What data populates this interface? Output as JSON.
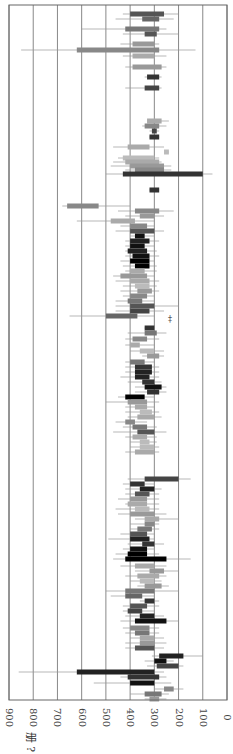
{
  "chart_data": {
    "type": "bar",
    "orientation": "rotated-90",
    "title": "",
    "xlabel": "",
    "ylabel": "册 ?",
    "axis_ticks": [
      "900",
      "800",
      "700",
      "600",
      "500",
      "400",
      "300",
      "200",
      "100",
      "0"
    ],
    "value_range": [
      0,
      900
    ],
    "grid": true,
    "legend": null,
    "annotation": "‡",
    "rows": [
      {
        "y": 14,
        "lo": 260,
        "hi": 400,
        "wlo": 200,
        "whi": 430,
        "shade": "#555"
      },
      {
        "y": 19,
        "lo": 280,
        "hi": 350,
        "wlo": 220,
        "whi": 460,
        "shade": "#666"
      },
      {
        "y": 29,
        "lo": 280,
        "hi": 420,
        "wlo": 250,
        "whi": 600,
        "shade": "#777"
      },
      {
        "y": 34,
        "lo": 290,
        "hi": 340,
        "wlo": 200,
        "whi": 430,
        "shade": "#555"
      },
      {
        "y": 44,
        "lo": 300,
        "hi": 390,
        "wlo": 280,
        "whi": 440,
        "shade": "#999"
      },
      {
        "y": 50,
        "lo": 280,
        "hi": 620,
        "wlo": 130,
        "whi": 850,
        "shade": "#888"
      },
      {
        "y": 56,
        "lo": 300,
        "hi": 390,
        "wlo": 250,
        "whi": 430,
        "shade": "#aaa"
      },
      {
        "y": 67,
        "lo": 270,
        "hi": 390,
        "wlo": 250,
        "whi": 420,
        "shade": "#999"
      },
      {
        "y": 77,
        "lo": 280,
        "hi": 330,
        "wlo": 270,
        "whi": 340,
        "shade": "#333"
      },
      {
        "y": 88,
        "lo": 280,
        "hi": 340,
        "wlo": 270,
        "whi": 420,
        "shade": "#444"
      },
      {
        "y": 121,
        "lo": 270,
        "hi": 330,
        "wlo": 240,
        "whi": 330,
        "shade": "#aaa"
      },
      {
        "y": 126,
        "lo": 280,
        "hi": 340,
        "wlo": 250,
        "whi": 350,
        "shade": "#888"
      },
      {
        "y": 131,
        "lo": 290,
        "hi": 310,
        "wlo": 280,
        "whi": 320,
        "shade": "#444"
      },
      {
        "y": 137,
        "lo": 280,
        "hi": 320,
        "wlo": 280,
        "whi": 320,
        "shade": "#333"
      },
      {
        "y": 147,
        "lo": 320,
        "hi": 410,
        "wlo": 260,
        "whi": 470,
        "shade": "#aaa"
      },
      {
        "y": 152,
        "lo": 240,
        "hi": 260,
        "wlo": 240,
        "whi": 260,
        "shade": "#bbb"
      },
      {
        "y": 158,
        "lo": 300,
        "hi": 430,
        "wlo": 280,
        "whi": 450,
        "shade": "#bbb"
      },
      {
        "y": 162,
        "lo": 280,
        "hi": 420,
        "wlo": 270,
        "whi": 470,
        "shade": "#aaa"
      },
      {
        "y": 166,
        "lo": 260,
        "hi": 400,
        "wlo": 230,
        "whi": 480,
        "shade": "#999"
      },
      {
        "y": 170,
        "lo": 260,
        "hi": 380,
        "wlo": 230,
        "whi": 420,
        "shade": "#888"
      },
      {
        "y": 174,
        "lo": 100,
        "hi": 430,
        "wlo": 60,
        "whi": 500,
        "shade": "#333"
      },
      {
        "y": 190,
        "lo": 280,
        "hi": 320,
        "wlo": 280,
        "whi": 320,
        "shade": "#333"
      },
      {
        "y": 206,
        "lo": 530,
        "hi": 660,
        "wlo": 400,
        "whi": 680,
        "shade": "#888"
      },
      {
        "y": 211,
        "lo": 280,
        "hi": 380,
        "wlo": 220,
        "whi": 450,
        "shade": "#888"
      },
      {
        "y": 216,
        "lo": 300,
        "hi": 360,
        "wlo": 260,
        "whi": 420,
        "shade": "#999"
      },
      {
        "y": 221,
        "lo": 380,
        "hi": 480,
        "wlo": 300,
        "whi": 620,
        "shade": "#aaa"
      },
      {
        "y": 226,
        "lo": 330,
        "hi": 400,
        "wlo": 300,
        "whi": 440,
        "shade": "#888"
      },
      {
        "y": 231,
        "lo": 300,
        "hi": 400,
        "wlo": 260,
        "whi": 460,
        "shade": "#555"
      },
      {
        "y": 236,
        "lo": 340,
        "hi": 380,
        "wlo": 300,
        "whi": 400,
        "shade": "#111"
      },
      {
        "y": 241,
        "lo": 320,
        "hi": 400,
        "wlo": 280,
        "whi": 420,
        "shade": "#222"
      },
      {
        "y": 246,
        "lo": 340,
        "hi": 400,
        "wlo": 300,
        "whi": 420,
        "shade": "#111"
      },
      {
        "y": 251,
        "lo": 330,
        "hi": 410,
        "wlo": 290,
        "whi": 420,
        "shade": "#222"
      },
      {
        "y": 256,
        "lo": 320,
        "hi": 390,
        "wlo": 280,
        "whi": 420,
        "shade": "#111"
      },
      {
        "y": 261,
        "lo": 320,
        "hi": 400,
        "wlo": 300,
        "whi": 440,
        "shade": "#000"
      },
      {
        "y": 266,
        "lo": 320,
        "hi": 380,
        "wlo": 290,
        "whi": 430,
        "shade": "#000"
      },
      {
        "y": 271,
        "lo": 340,
        "hi": 400,
        "wlo": 290,
        "whi": 420,
        "shade": "#aaa"
      },
      {
        "y": 276,
        "lo": 330,
        "hi": 440,
        "wlo": 300,
        "whi": 470,
        "shade": "#999"
      },
      {
        "y": 281,
        "lo": 320,
        "hi": 400,
        "wlo": 280,
        "whi": 460,
        "shade": "#aaa"
      },
      {
        "y": 286,
        "lo": 320,
        "hi": 380,
        "wlo": 290,
        "whi": 430,
        "shade": "#bbb"
      },
      {
        "y": 291,
        "lo": 310,
        "hi": 370,
        "wlo": 280,
        "whi": 440,
        "shade": "#999"
      },
      {
        "y": 296,
        "lo": 330,
        "hi": 400,
        "wlo": 300,
        "whi": 430,
        "shade": "#888"
      },
      {
        "y": 301,
        "lo": 350,
        "hi": 410,
        "wlo": 300,
        "whi": 460,
        "shade": "#777"
      },
      {
        "y": 306,
        "lo": 300,
        "hi": 400,
        "wlo": 200,
        "whi": 460,
        "shade": "#555"
      },
      {
        "y": 311,
        "lo": 320,
        "hi": 400,
        "wlo": 260,
        "whi": 460,
        "shade": "#444"
      },
      {
        "y": 316,
        "lo": 370,
        "hi": 500,
        "wlo": 300,
        "whi": 650,
        "shade": "#666"
      },
      {
        "y": 328,
        "lo": 300,
        "hi": 340,
        "wlo": 300,
        "whi": 340,
        "shade": "#333"
      },
      {
        "y": 333,
        "lo": 290,
        "hi": 340,
        "wlo": 250,
        "whi": 410,
        "shade": "#777"
      },
      {
        "y": 339,
        "lo": 330,
        "hi": 390,
        "wlo": 280,
        "whi": 420,
        "shade": "#888"
      },
      {
        "y": 345,
        "lo": 360,
        "hi": 400,
        "wlo": 300,
        "whi": 420,
        "shade": "#aaa"
      },
      {
        "y": 351,
        "lo": 300,
        "hi": 360,
        "wlo": 260,
        "whi": 400,
        "shade": "#bbb"
      },
      {
        "y": 356,
        "lo": 280,
        "hi": 330,
        "wlo": 260,
        "whi": 350,
        "shade": "#999"
      },
      {
        "y": 362,
        "lo": 340,
        "hi": 400,
        "wlo": 300,
        "whi": 420,
        "shade": "#777"
      },
      {
        "y": 367,
        "lo": 310,
        "hi": 380,
        "wlo": 280,
        "whi": 420,
        "shade": "#333"
      },
      {
        "y": 372,
        "lo": 310,
        "hi": 380,
        "wlo": 280,
        "whi": 420,
        "shade": "#222"
      },
      {
        "y": 377,
        "lo": 320,
        "hi": 380,
        "wlo": 280,
        "whi": 440,
        "shade": "#222"
      },
      {
        "y": 382,
        "lo": 300,
        "hi": 350,
        "wlo": 270,
        "whi": 410,
        "shade": "#333"
      },
      {
        "y": 387,
        "lo": 270,
        "hi": 340,
        "wlo": 250,
        "whi": 380,
        "shade": "#111"
      },
      {
        "y": 392,
        "lo": 280,
        "hi": 330,
        "wlo": 250,
        "whi": 380,
        "shade": "#333"
      },
      {
        "y": 397,
        "lo": 340,
        "hi": 420,
        "wlo": 300,
        "whi": 450,
        "shade": "#000"
      },
      {
        "y": 402,
        "lo": 330,
        "hi": 410,
        "wlo": 280,
        "whi": 500,
        "shade": "#999"
      },
      {
        "y": 407,
        "lo": 330,
        "hi": 380,
        "wlo": 300,
        "whi": 420,
        "shade": "#aaa"
      },
      {
        "y": 412,
        "lo": 310,
        "hi": 360,
        "wlo": 280,
        "whi": 420,
        "shade": "#bbb"
      },
      {
        "y": 417,
        "lo": 300,
        "hi": 370,
        "wlo": 270,
        "whi": 410,
        "shade": "#aaa"
      },
      {
        "y": 422,
        "lo": 380,
        "hi": 420,
        "wlo": 330,
        "whi": 460,
        "shade": "#888"
      },
      {
        "y": 427,
        "lo": 330,
        "hi": 390,
        "wlo": 290,
        "whi": 430,
        "shade": "#777"
      },
      {
        "y": 432,
        "lo": 300,
        "hi": 370,
        "wlo": 250,
        "whi": 470,
        "shade": "#555"
      },
      {
        "y": 437,
        "lo": 330,
        "hi": 390,
        "wlo": 290,
        "whi": 420,
        "shade": "#aaa"
      },
      {
        "y": 442,
        "lo": 320,
        "hi": 360,
        "wlo": 290,
        "whi": 400,
        "shade": "#bbb"
      },
      {
        "y": 447,
        "lo": 300,
        "hi": 360,
        "wlo": 280,
        "whi": 400,
        "shade": "#bbb"
      },
      {
        "y": 452,
        "lo": 300,
        "hi": 380,
        "wlo": 280,
        "whi": 420,
        "shade": "#aaa"
      },
      {
        "y": 479,
        "lo": 200,
        "hi": 340,
        "wlo": 150,
        "whi": 410,
        "shade": "#444"
      },
      {
        "y": 484,
        "lo": 340,
        "hi": 400,
        "wlo": 300,
        "whi": 430,
        "shade": "#333"
      },
      {
        "y": 489,
        "lo": 300,
        "hi": 360,
        "wlo": 270,
        "whi": 420,
        "shade": "#222"
      },
      {
        "y": 494,
        "lo": 320,
        "hi": 380,
        "wlo": 280,
        "whi": 420,
        "shade": "#555"
      },
      {
        "y": 499,
        "lo": 330,
        "hi": 400,
        "wlo": 280,
        "whi": 450,
        "shade": "#999"
      },
      {
        "y": 504,
        "lo": 330,
        "hi": 410,
        "wlo": 280,
        "whi": 420,
        "shade": "#aaa"
      },
      {
        "y": 509,
        "lo": 320,
        "hi": 380,
        "wlo": 280,
        "whi": 460,
        "shade": "#bbb"
      },
      {
        "y": 514,
        "lo": 300,
        "hi": 400,
        "wlo": 250,
        "whi": 450,
        "shade": "#999"
      },
      {
        "y": 519,
        "lo": 280,
        "hi": 340,
        "wlo": 200,
        "whi": 380,
        "shade": "#aaa"
      },
      {
        "y": 524,
        "lo": 300,
        "hi": 340,
        "wlo": 280,
        "whi": 400,
        "shade": "#888"
      },
      {
        "y": 529,
        "lo": 310,
        "hi": 370,
        "wlo": 280,
        "whi": 400,
        "shade": "#777"
      },
      {
        "y": 534,
        "lo": 330,
        "hi": 400,
        "wlo": 300,
        "whi": 440,
        "shade": "#555"
      },
      {
        "y": 539,
        "lo": 320,
        "hi": 400,
        "wlo": 300,
        "whi": 490,
        "shade": "#222"
      },
      {
        "y": 544,
        "lo": 300,
        "hi": 350,
        "wlo": 260,
        "whi": 410,
        "shade": "#333"
      },
      {
        "y": 549,
        "lo": 330,
        "hi": 400,
        "wlo": 300,
        "whi": 430,
        "shade": "#111"
      },
      {
        "y": 554,
        "lo": 330,
        "hi": 410,
        "wlo": 280,
        "whi": 460,
        "shade": "#000"
      },
      {
        "y": 559,
        "lo": 250,
        "hi": 420,
        "wlo": 150,
        "whi": 470,
        "shade": "#000"
      },
      {
        "y": 566,
        "lo": 300,
        "hi": 380,
        "wlo": 250,
        "whi": 440,
        "shade": "#aaa"
      },
      {
        "y": 571,
        "lo": 260,
        "hi": 320,
        "wlo": 200,
        "whi": 380,
        "shade": "#999"
      },
      {
        "y": 576,
        "lo": 280,
        "hi": 370,
        "wlo": 250,
        "whi": 420,
        "shade": "#aaa"
      },
      {
        "y": 581,
        "lo": 300,
        "hi": 360,
        "wlo": 270,
        "whi": 400,
        "shade": "#bbb"
      },
      {
        "y": 586,
        "lo": 270,
        "hi": 340,
        "wlo": 240,
        "whi": 370,
        "shade": "#999"
      },
      {
        "y": 591,
        "lo": 300,
        "hi": 420,
        "wlo": 200,
        "whi": 500,
        "shade": "#777"
      },
      {
        "y": 596,
        "lo": 350,
        "hi": 420,
        "wlo": 300,
        "whi": 480,
        "shade": "#666"
      },
      {
        "y": 601,
        "lo": 300,
        "hi": 340,
        "wlo": 280,
        "whi": 360,
        "shade": "#333"
      },
      {
        "y": 606,
        "lo": 330,
        "hi": 400,
        "wlo": 280,
        "whi": 430,
        "shade": "#555"
      },
      {
        "y": 611,
        "lo": 350,
        "hi": 410,
        "wlo": 300,
        "whi": 430,
        "shade": "#444"
      },
      {
        "y": 616,
        "lo": 300,
        "hi": 360,
        "wlo": 260,
        "whi": 420,
        "shade": "#222"
      },
      {
        "y": 621,
        "lo": 250,
        "hi": 380,
        "wlo": 200,
        "whi": 440,
        "shade": "#111"
      },
      {
        "y": 628,
        "lo": 320,
        "hi": 400,
        "wlo": 280,
        "whi": 430,
        "shade": "#888"
      },
      {
        "y": 633,
        "lo": 320,
        "hi": 380,
        "wlo": 280,
        "whi": 420,
        "shade": "#777"
      },
      {
        "y": 638,
        "lo": 300,
        "hi": 360,
        "wlo": 260,
        "whi": 400,
        "shade": "#aaa"
      },
      {
        "y": 643,
        "lo": 300,
        "hi": 360,
        "wlo": 250,
        "whi": 420,
        "shade": "#999"
      },
      {
        "y": 648,
        "lo": 300,
        "hi": 380,
        "wlo": 260,
        "whi": 420,
        "shade": "#555"
      },
      {
        "y": 656,
        "lo": 180,
        "hi": 280,
        "wlo": 100,
        "whi": 310,
        "shade": "#222"
      },
      {
        "y": 661,
        "lo": 250,
        "hi": 300,
        "wlo": 220,
        "whi": 340,
        "shade": "#111"
      },
      {
        "y": 666,
        "lo": 200,
        "hi": 290,
        "wlo": 180,
        "whi": 330,
        "shade": "#444"
      },
      {
        "y": 672,
        "lo": 300,
        "hi": 620,
        "wlo": 260,
        "whi": 860,
        "shade": "#222"
      },
      {
        "y": 677,
        "lo": 280,
        "hi": 410,
        "wlo": 250,
        "whi": 440,
        "shade": "#333"
      },
      {
        "y": 683,
        "lo": 300,
        "hi": 400,
        "wlo": 230,
        "whi": 550,
        "shade": "#111"
      },
      {
        "y": 689,
        "lo": 220,
        "hi": 260,
        "wlo": 180,
        "whi": 300,
        "shade": "#888"
      },
      {
        "y": 694,
        "lo": 270,
        "hi": 340,
        "wlo": 240,
        "whi": 400,
        "shade": "#777"
      },
      {
        "y": 699,
        "lo": 280,
        "hi": 320,
        "wlo": 250,
        "whi": 340,
        "shade": "#999"
      }
    ]
  }
}
